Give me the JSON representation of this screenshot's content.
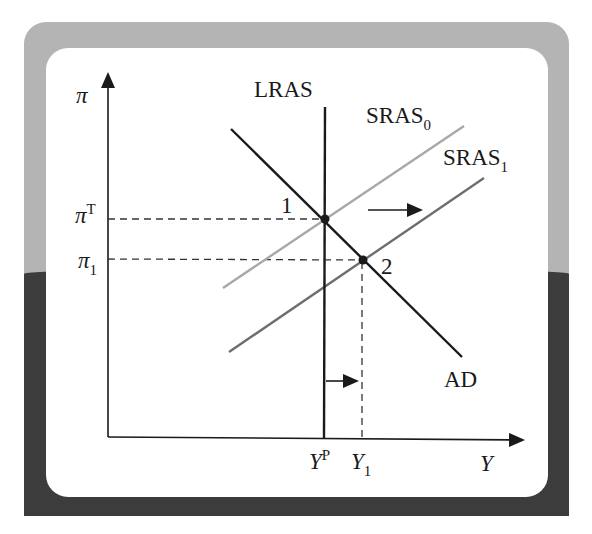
{
  "diagram": {
    "type": "AD-AS model",
    "axes": {
      "y_label": "π",
      "x_label": "Y"
    },
    "curves": {
      "lras": "LRAS",
      "sras0": {
        "base": "SRAS",
        "sub": "0"
      },
      "sras1": {
        "base": "SRAS",
        "sub": "1"
      },
      "ad": "AD"
    },
    "levels": {
      "pi_target": {
        "base": "π",
        "sup": "T"
      },
      "pi_1": {
        "base": "π",
        "sub": "1"
      },
      "y_potential": {
        "base": "Y",
        "sup": "P"
      },
      "y_1": {
        "base": "Y",
        "sub": "1"
      }
    },
    "points": {
      "p1": "1",
      "p2": "2"
    },
    "colors": {
      "frame_light": "#b4b4b4",
      "frame_dark": "#3c3c3c",
      "panel": "#ffffff",
      "line_black": "#1a1a1a",
      "sras0": "#a8a8a8",
      "sras1": "#6e6e6e"
    }
  }
}
